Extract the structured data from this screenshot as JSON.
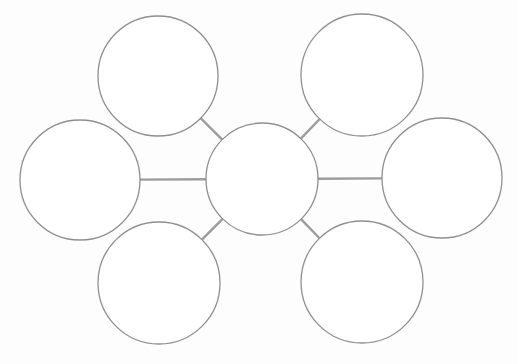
{
  "diagram": {
    "type": "bubble-map",
    "title": "",
    "colors": {
      "background": "#ffffff",
      "node_stroke": "#8f8f8f",
      "node_fill": "#ffffff",
      "edge": "#9c9c9c"
    },
    "center": {
      "id": "center",
      "label": ""
    },
    "nodes": [
      {
        "id": "top-left",
        "label": ""
      },
      {
        "id": "top-right",
        "label": ""
      },
      {
        "id": "left",
        "label": ""
      },
      {
        "id": "right",
        "label": ""
      },
      {
        "id": "bottom-left",
        "label": ""
      },
      {
        "id": "bottom-right",
        "label": ""
      }
    ],
    "edges": [
      {
        "from": "center",
        "to": "top-left"
      },
      {
        "from": "center",
        "to": "top-right"
      },
      {
        "from": "center",
        "to": "left"
      },
      {
        "from": "center",
        "to": "right"
      },
      {
        "from": "center",
        "to": "bottom-left"
      },
      {
        "from": "center",
        "to": "bottom-right"
      }
    ]
  }
}
